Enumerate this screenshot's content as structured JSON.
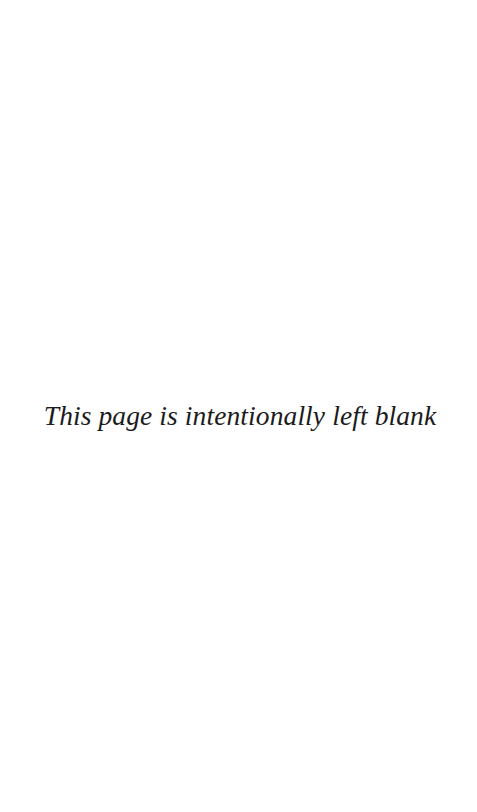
{
  "page": {
    "background_color": "#ffffff",
    "width_px": 477,
    "height_px": 812
  },
  "notice": {
    "text": "This page is intentionally left blank",
    "color": "#1c1c1c",
    "style": "italic-serif",
    "font_size_px": 27.5,
    "alignment": "center",
    "vertical_position_percent": 51
  },
  "blank_regions": {
    "top_label": "",
    "bottom_label": ""
  }
}
